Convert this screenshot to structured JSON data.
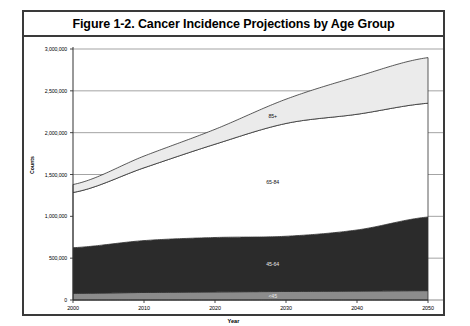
{
  "figure": {
    "title": "Figure 1-2. Cancer Incidence Projections by Age Group"
  },
  "chart_data": {
    "type": "area",
    "stacked": true,
    "title": "Figure 1-2. Cancer Incidence Projections by Age Group",
    "xlabel": "Year",
    "ylabel": "Counts",
    "x": [
      2000,
      2010,
      2020,
      2030,
      2040,
      2050
    ],
    "xlim": [
      2000,
      2050
    ],
    "xticks": [
      2000,
      2010,
      2020,
      2030,
      2040,
      2050
    ],
    "xtick_labels": [
      "2000",
      "2010",
      "2020",
      "2030",
      "2040",
      "2050"
    ],
    "ylim": [
      0,
      3000000
    ],
    "yticks": [
      0,
      500000,
      1000000,
      1500000,
      2000000,
      2500000,
      3000000
    ],
    "ytick_labels": [
      "0",
      "500,000",
      "1,000,000",
      "1,500,000",
      "2,000,000",
      "2,500,000",
      "3,000,000"
    ],
    "grid": true,
    "grid_axis": "y",
    "legend": "inline-band-labels",
    "series": [
      {
        "name": "<45",
        "label": "<45",
        "color": "#8c8c8c",
        "values": [
          80000,
          90000,
          97000,
          102000,
          107000,
          112000
        ]
      },
      {
        "name": "45-64",
        "label": "45-64",
        "color": "#2b2b2b",
        "values": [
          545000,
          620000,
          650000,
          660000,
          730000,
          880000
        ]
      },
      {
        "name": "65-84",
        "label": "65-84",
        "color": "#ffffff",
        "values": [
          660000,
          870000,
          1115000,
          1348000,
          1383000,
          1360000
        ]
      },
      {
        "name": "85+",
        "label": "85+",
        "color": "#ebebeb",
        "values": [
          95000,
          140000,
          178000,
          290000,
          450000,
          545000
        ]
      }
    ],
    "cumulative_totals": [
      1380000,
      1720000,
      2040000,
      2400000,
      2670000,
      2897000
    ]
  }
}
